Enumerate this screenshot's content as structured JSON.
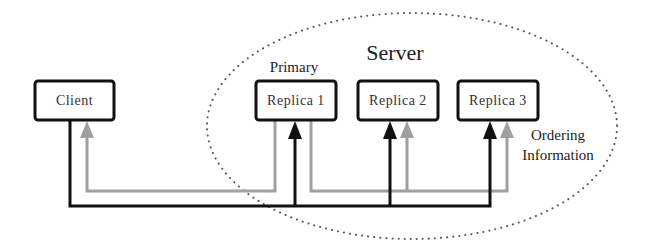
{
  "diagram": {
    "server_label": "Server",
    "primary_label": "Primary",
    "ordering_label_line1": "Ordering",
    "ordering_label_line2": "Information",
    "nodes": [
      {
        "id": "client",
        "label": "Client"
      },
      {
        "id": "replica1",
        "label": "Replica 1"
      },
      {
        "id": "replica2",
        "label": "Replica 2"
      },
      {
        "id": "replica3",
        "label": "Replica 3"
      }
    ],
    "colors": {
      "request_line": "#111111",
      "response_line": "#a0a0a0",
      "box_border": "#111111",
      "server_boundary": "#555555"
    },
    "edges": [
      {
        "from": "client",
        "to": "replica1",
        "type": "request",
        "color": "black"
      },
      {
        "from": "client",
        "to": "replica2",
        "type": "request",
        "color": "black"
      },
      {
        "from": "client",
        "to": "replica3",
        "type": "request",
        "color": "black"
      },
      {
        "from": "replica1",
        "to": "client",
        "type": "response",
        "color": "gray"
      },
      {
        "from": "replica1",
        "to": "replica2",
        "type": "ordering",
        "color": "gray"
      },
      {
        "from": "replica1",
        "to": "replica3",
        "type": "ordering",
        "color": "gray"
      }
    ]
  }
}
